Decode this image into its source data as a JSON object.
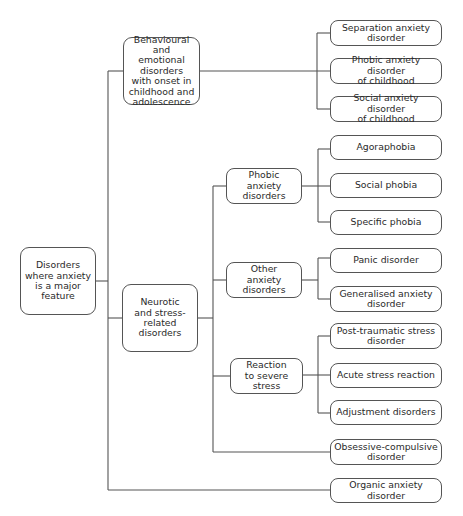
{
  "diagram": {
    "title": "Disorders where anxiety is a major feature",
    "root": {
      "label": "Disorders\nwhere anxiety\nis a major\nfeature"
    },
    "level1": {
      "behavioural": {
        "label": "Behavioural and\nemotional\ndisorders\nwith onset in\nchildhood and\nadolescence"
      },
      "neurotic": {
        "label": "Neurotic\nand stress-\nrelated\ndisorders"
      },
      "organic": {
        "label": "Organic anxiety disorder"
      }
    },
    "behavioural_children": [
      {
        "label": "Separation anxiety\ndisorder"
      },
      {
        "label": "Phobic anxiety disorder\nof childhood"
      },
      {
        "label": "Social anxiety disorder\nof childhood"
      }
    ],
    "level2": {
      "phobic": {
        "label": "Phobic\nanxiety\ndisorders"
      },
      "other": {
        "label": "Other\nanxiety\ndisorders"
      },
      "reaction": {
        "label": "Reaction\nto severe\nstress"
      },
      "ocd": {
        "label": "Obsessive-compulsive\ndisorder"
      }
    },
    "phobic_children": [
      {
        "label": "Agoraphobia"
      },
      {
        "label": "Social phobia"
      },
      {
        "label": "Specific phobia"
      }
    ],
    "other_children": [
      {
        "label": "Panic disorder"
      },
      {
        "label": "Generalised anxiety\ndisorder"
      }
    ],
    "reaction_children": [
      {
        "label": "Post-traumatic stress\ndisorder"
      },
      {
        "label": "Acute stress reaction"
      },
      {
        "label": "Adjustment disorders"
      }
    ],
    "colors": {
      "line": "#555555",
      "text": "#2a2a2a",
      "background": "#ffffff"
    }
  }
}
